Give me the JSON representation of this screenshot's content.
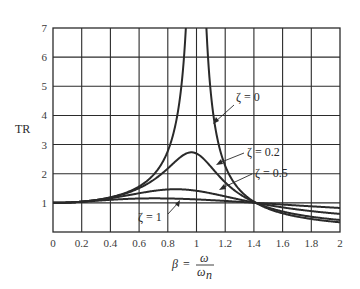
{
  "chart_data": {
    "type": "line",
    "title": "",
    "xlabel": "β = ω/ωn",
    "xlabel_parts": {
      "lhs": "β",
      "eq": "=",
      "num": "ω",
      "den": "ω",
      "den_sub": "n"
    },
    "ylabel": "TR",
    "xlim": [
      0,
      2
    ],
    "ylim": [
      0,
      7
    ],
    "grid": true,
    "legend": "inline labels with leader arrows",
    "x_ticks": [
      "0",
      "0.2",
      "0.4",
      "0.6",
      "0.8",
      "1",
      "1.2",
      "1.4",
      "1.6",
      "1.8",
      "2"
    ],
    "y_ticks": [
      "1",
      "2",
      "3",
      "4",
      "5",
      "6",
      "7"
    ],
    "x": [
      0,
      0.1,
      0.2,
      0.3,
      0.4,
      0.5,
      0.6,
      0.7,
      0.8,
      0.85,
      0.9,
      0.95,
      1.0,
      1.05,
      1.1,
      1.15,
      1.2,
      1.3,
      1.4,
      1.5,
      1.6,
      1.7,
      1.8,
      1.9,
      2.0
    ],
    "series": [
      {
        "name": "ζ = 0",
        "label": "ζ = 0",
        "values": [
          1.0,
          1.01,
          1.042,
          1.099,
          1.19,
          1.333,
          1.563,
          1.961,
          2.778,
          3.604,
          5.263,
          10.26,
          null,
          9.756,
          4.762,
          3.101,
          2.273,
          1.449,
          1.042,
          0.8,
          0.641,
          0.529,
          0.446,
          0.383,
          0.333
        ]
      },
      {
        "name": "ζ = 0.2",
        "label": "ζ = 0.2",
        "values": [
          1.0,
          1.01,
          1.041,
          1.095,
          1.178,
          1.301,
          1.485,
          1.76,
          2.156,
          2.386,
          2.593,
          2.723,
          2.693,
          2.529,
          2.274,
          2.006,
          1.759,
          1.359,
          1.076,
          0.877,
          0.734,
          0.628,
          0.547,
          0.484,
          0.433
        ]
      },
      {
        "name": "ζ = 0.5",
        "label": "ζ = 0.5",
        "values": [
          1.0,
          1.01,
          1.038,
          1.081,
          1.139,
          1.212,
          1.295,
          1.38,
          1.454,
          1.48,
          1.497,
          1.503,
          1.494,
          1.473,
          1.44,
          1.399,
          1.352,
          1.249,
          1.149,
          1.058,
          0.979,
          0.911,
          0.853,
          0.803,
          0.76
        ]
      },
      {
        "name": "ζ = 1",
        "label": "ζ = 1",
        "values": [
          1.0,
          1.009,
          1.034,
          1.069,
          1.108,
          1.146,
          1.176,
          1.193,
          1.195,
          1.19,
          1.182,
          1.17,
          1.156,
          1.14,
          1.123,
          1.105,
          1.087,
          1.05,
          1.014,
          0.981,
          0.95,
          0.923,
          0.899,
          0.877,
          0.857
        ]
      }
    ]
  }
}
